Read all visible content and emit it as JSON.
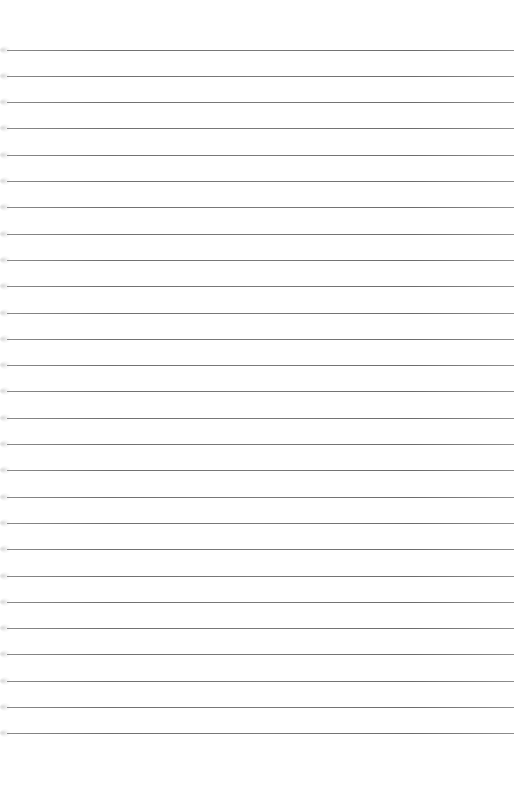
{
  "document": {
    "type": "lined-paper",
    "background_color": "#ffffff",
    "line_color": "#767676",
    "line_count": 27,
    "first_line_y": 49.5,
    "line_pitch": 26.3,
    "line_left": 7,
    "line_right": 514,
    "text_content": []
  }
}
